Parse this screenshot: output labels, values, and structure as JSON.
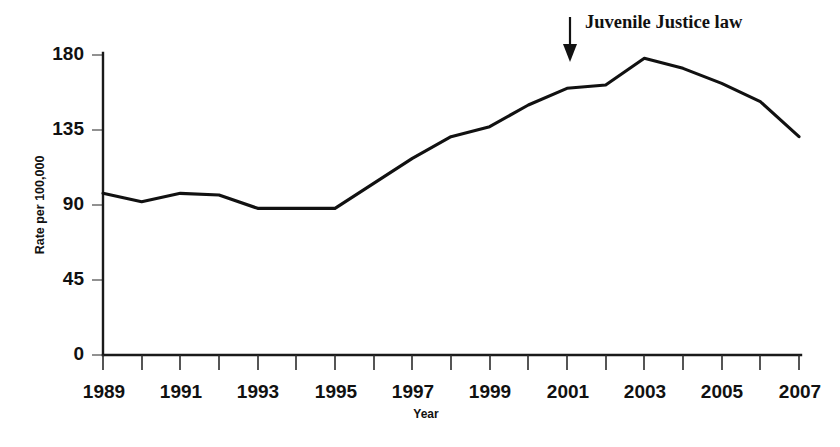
{
  "chart_data": {
    "type": "line",
    "title": "",
    "xlabel": "Year",
    "ylabel": "Rate per 100,000",
    "x": [
      1989,
      1990,
      1991,
      1992,
      1993,
      1994,
      1995,
      1996,
      1997,
      1998,
      1999,
      2000,
      2001,
      2002,
      2003,
      2004,
      2005,
      2006,
      2007
    ],
    "values": [
      97,
      92,
      97,
      96,
      88,
      88,
      88,
      103,
      118,
      131,
      137,
      150,
      160,
      162,
      178,
      172,
      163,
      152,
      131
    ],
    "series": [
      {
        "name": "Rate per 100,000",
        "values": [
          97,
          92,
          97,
          96,
          88,
          88,
          88,
          103,
          118,
          131,
          137,
          150,
          160,
          162,
          178,
          172,
          163,
          152,
          131
        ]
      }
    ],
    "xlim": [
      1989,
      2007
    ],
    "ylim": [
      0,
      180
    ],
    "yticks": [
      0,
      45,
      90,
      135,
      180
    ],
    "ytick_labels": [
      "0",
      "45",
      "90",
      "135",
      "180"
    ],
    "xticks": [
      1989,
      1990,
      1991,
      1992,
      1993,
      1994,
      1995,
      1996,
      1997,
      1998,
      1999,
      2000,
      2001,
      2002,
      2003,
      2004,
      2005,
      2006,
      2007
    ],
    "xtick_labels_shown": [
      "1989",
      "1991",
      "1993",
      "1995",
      "1997",
      "1999",
      "2001",
      "2003",
      "2005",
      "2007"
    ],
    "grid": false,
    "legend": "none",
    "line_color": "#111111",
    "annotations": [
      {
        "text": "Juvenile Justice law",
        "points_to_year": 2001,
        "marker": "down-arrow"
      }
    ]
  },
  "axes": {
    "y_title": "Rate per 100,000",
    "x_title": "Year",
    "y_labels": [
      "180",
      "135",
      "90",
      "45",
      "0"
    ],
    "x_labels": [
      "1989",
      "1991",
      "1993",
      "1995",
      "1997",
      "1999",
      "2001",
      "2003",
      "2005",
      "2007"
    ]
  },
  "annotation": {
    "label": "Juvenile Justice law"
  },
  "caption": {
    "ghost_text": ""
  }
}
